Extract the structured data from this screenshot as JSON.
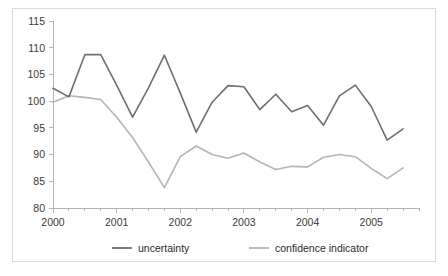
{
  "chart_data": {
    "type": "line",
    "title": "",
    "xlabel": "",
    "ylabel": "",
    "ylim": [
      80,
      115
    ],
    "yticks": [
      80,
      85,
      90,
      95,
      100,
      105,
      110,
      115
    ],
    "ytick_labels": [
      "80",
      "85",
      "90",
      "95",
      "100",
      "105",
      "110",
      "115"
    ],
    "xtick_labels": [
      "2000",
      "2001",
      "2002",
      "2003",
      "2004",
      "2005"
    ],
    "x_major_values": [
      2000,
      2001,
      2002,
      2003,
      2004,
      2005
    ],
    "xlim": [
      2000,
      2005.75
    ],
    "x_minor_step": 0.25,
    "grid": false,
    "legend_position": "bottom",
    "x": [
      2000.0,
      2000.25,
      2000.5,
      2000.75,
      2001.0,
      2001.25,
      2001.5,
      2001.75,
      2002.0,
      2002.25,
      2002.5,
      2002.75,
      2003.0,
      2003.25,
      2003.5,
      2003.75,
      2004.0,
      2004.25,
      2004.5,
      2004.75,
      2005.0,
      2005.25,
      2005.5
    ],
    "x_labels": [
      "2000Q1",
      "2000Q2",
      "2000Q3",
      "2000Q4",
      "2001Q1",
      "2001Q2",
      "2001Q3",
      "2001Q4",
      "2002Q1",
      "2002Q2",
      "2002Q3",
      "2002Q4",
      "2003Q1",
      "2003Q2",
      "2003Q3",
      "2003Q4",
      "2004Q1",
      "2004Q2",
      "2004Q3",
      "2004Q4",
      "2005Q1",
      "2005Q2",
      "2005Q3"
    ],
    "series": [
      {
        "name": "uncertainty",
        "color": "#6e6e6e",
        "values": [
          102.4,
          100.8,
          108.7,
          108.7,
          103.0,
          97.0,
          102.5,
          108.6,
          101.5,
          94.2,
          99.8,
          102.9,
          102.7,
          98.4,
          101.3,
          98.0,
          99.2,
          95.5,
          101.0,
          103.0,
          99.0,
          92.7,
          94.8
        ]
      },
      {
        "name": "confidence indicator",
        "color": "#b5b5b5",
        "values": [
          99.8,
          101.0,
          100.7,
          100.3,
          97.0,
          93.2,
          88.6,
          83.8,
          89.6,
          91.6,
          90.0,
          89.3,
          90.3,
          88.6,
          87.2,
          87.8,
          87.7,
          89.5,
          90.0,
          89.6,
          87.4,
          85.5,
          87.5
        ]
      }
    ]
  },
  "legend": {
    "items": [
      {
        "label": "uncertainty",
        "color": "#6e6e6e"
      },
      {
        "label": "confidence indicator",
        "color": "#b5b5b5"
      }
    ]
  }
}
